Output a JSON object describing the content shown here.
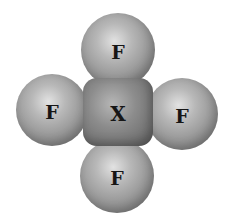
{
  "diagram": {
    "title": "",
    "type": "molecule-space-filling-model",
    "central_atom": {
      "label": "X",
      "color": "#7a7a7a"
    },
    "ligands": [
      {
        "position": "top",
        "label": "F",
        "color": "#a8a8a8"
      },
      {
        "position": "left",
        "label": "F",
        "color": "#a8a8a8"
      },
      {
        "position": "right",
        "label": "F",
        "color": "#a8a8a8"
      },
      {
        "position": "bottom",
        "label": "F",
        "color": "#a8a8a8"
      }
    ]
  }
}
